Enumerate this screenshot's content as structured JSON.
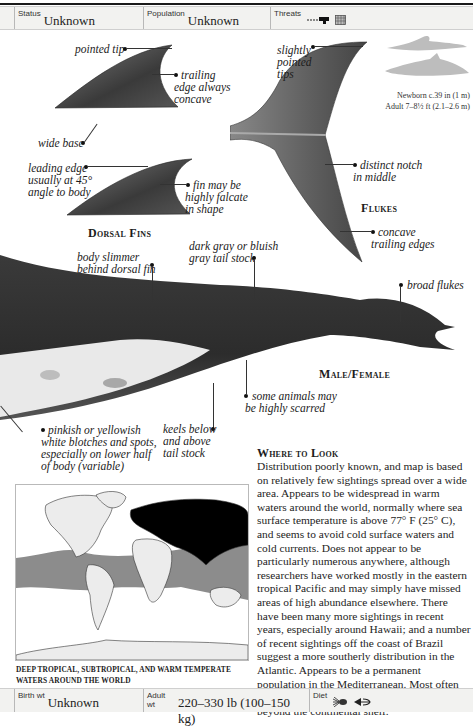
{
  "top_bar": {
    "status": {
      "label": "Status",
      "value": "Unknown"
    },
    "population": {
      "label": "Population",
      "value": "Unknown"
    },
    "threats": {
      "label": "Threats",
      "icons": [
        "harpoon-icon",
        "fishing-net-icon"
      ]
    }
  },
  "dorsal_fins": {
    "heading": "Dorsal Fins",
    "annotations": {
      "pointed_tip": "pointed tip",
      "trailing_edge_1": "trailing",
      "trailing_edge_2": "edge always",
      "trailing_edge_3": "concave",
      "wide_base": "wide base",
      "leading_edge_1": "leading edge",
      "leading_edge_2": "usually at 45°",
      "leading_edge_3": "angle to body",
      "falcate_1": "fin may be",
      "falcate_2": "highly falcate",
      "falcate_3": "in shape"
    }
  },
  "flukes": {
    "heading": "Flukes",
    "annotations": {
      "tips_1": "slightly",
      "tips_2": "pointed",
      "tips_3": "tips",
      "notch_1": "distinct notch",
      "notch_2": "in middle",
      "trailing_1": "concave",
      "trailing_2": "trailing edges"
    }
  },
  "size_comparison": {
    "newborn": "Newborn c.39 in (1 m)",
    "adult": "Adult 7–8½ ft (2.1–2.6 m)"
  },
  "body": {
    "heading": "Male/Female",
    "annotations": {
      "slimmer_1": "body slimmer",
      "slimmer_2": "behind dorsal fin",
      "tailstock_1": "dark gray or bluish",
      "tailstock_2": "gray tail stock",
      "broad_flukes": "broad flukes",
      "scarred_1": "some animals may",
      "scarred_2": "be highly scarred",
      "blotches_1": "pinkish or yellowish",
      "blotches_2": "white blotches and spots,",
      "blotches_3": "especially on lower half",
      "blotches_4": "of body (variable)",
      "keels_1": "keels below",
      "keels_2": "and above",
      "keels_3": "tail stock"
    }
  },
  "map": {
    "caption_1": "DEEP TROPICAL, SUBTROPICAL, AND WARM TEMPERATE",
    "caption_2": "WATERS AROUND THE WORLD",
    "range_color": "#8c8c8c",
    "land_color": "#ececec"
  },
  "where_to_look": {
    "title": "Where to Look",
    "text": "Distribution poorly known, and map is based on relatively few sightings spread over a wide area. Appears to be widespread in warm waters around the world, normally where sea surface temperature is above 77° F (25° C), and seems to avoid cold surface waters and cold currents. Does not appear to be particularly numerous anywhere, although researchers have worked mostly in the eastern tropical Pacific and may simply have missed areas of high abundance elsewhere. There have been many more sightings in recent years, especially around Hawaii; and a number of recent sightings off the coast of Brazil suggest a more southerly distribution in the Atlantic. Appears to be a permanent population in the Mediterranean. Most often found in deep water far offshore, usually beyond the continental shelf."
  },
  "bottom_bar": {
    "birth_wt": {
      "label": "Birth wt",
      "value": "Unknown"
    },
    "adult_wt": {
      "label": "Adult wt",
      "value": "220–330 lb (100–150 kg)"
    },
    "diet": {
      "label": "Diet",
      "icons": [
        "squid-icon",
        "fish-icon"
      ]
    }
  }
}
